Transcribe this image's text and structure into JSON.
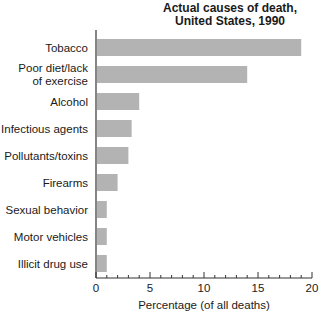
{
  "chart_data": {
    "type": "bar",
    "orientation": "horizontal",
    "title": "Actual causes of death, United States, 1990",
    "title_lines": [
      "Actual causes of death,",
      "United States, 1990"
    ],
    "categories": [
      "Tobacco",
      "Poor diet/lack of exercise",
      "Alcohol",
      "Infectious agents",
      "Pollutants/toxins",
      "Firearms",
      "Sexual behavior",
      "Motor vehicles",
      "Illicit drug use"
    ],
    "category_label_lines": [
      [
        "Tobacco"
      ],
      [
        "Poor diet/lack",
        "of exercise"
      ],
      [
        "Alcohol"
      ],
      [
        "Infectious agents"
      ],
      [
        "Pollutants/toxins"
      ],
      [
        "Firearms"
      ],
      [
        "Sexual behavior"
      ],
      [
        "Motor vehicles"
      ],
      [
        "Illicit drug use"
      ]
    ],
    "values": [
      19,
      14,
      4,
      3.3,
      3,
      2,
      1,
      1,
      1
    ],
    "xlabel": "Percentage (of all deaths)",
    "ylabel": "",
    "xlim": [
      0,
      20
    ],
    "x_ticks": [
      0,
      5,
      10,
      15,
      20
    ],
    "x_minor_tick_step": 1,
    "grid": false,
    "legend": null,
    "bar_color": "#b3b3b3"
  }
}
